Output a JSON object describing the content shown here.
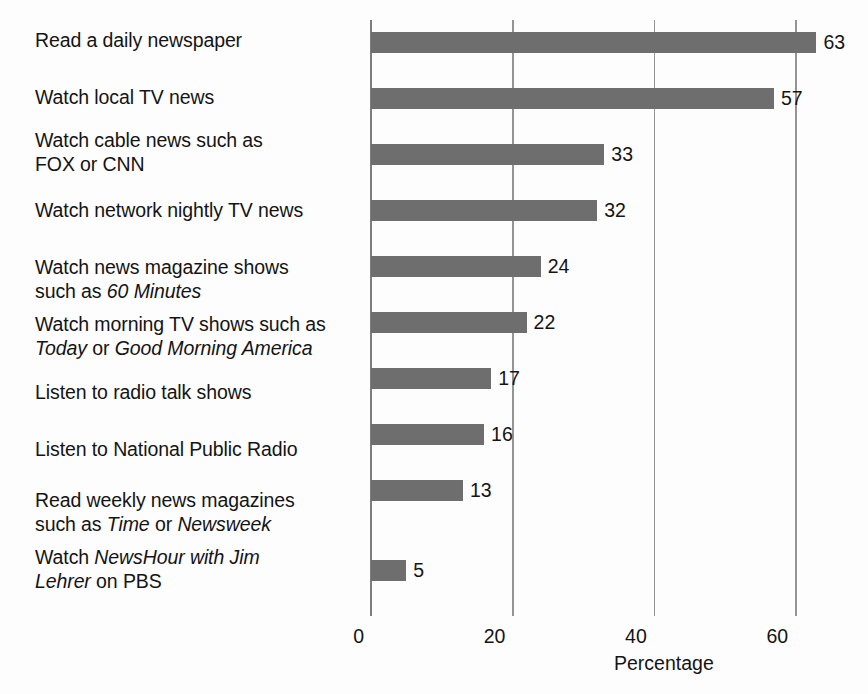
{
  "chart_data": {
    "type": "bar",
    "orientation": "horizontal",
    "title": "",
    "subtitle": "",
    "xlabel": "Percentage",
    "ylabel": "",
    "xlim": [
      0,
      67
    ],
    "xticks": [
      0,
      20,
      40,
      60
    ],
    "xtick_labels": [
      "0",
      "20",
      "40",
      "60"
    ],
    "grid": "vertical-gridlines-at-xticks",
    "legend": "none",
    "bar_color": "#6e6e6e",
    "value_labels_shown": true,
    "categories": [
      "Read a daily newspaper",
      "Watch local TV news",
      "Watch cable news such as FOX or CNN",
      "Watch network nightly TV news",
      "Watch news magazine shows such as 60 Minutes",
      "Watch morning TV shows such as Today or Good Morning America",
      "Listen to radio talk shows",
      "Listen to National Public Radio",
      "Read weekly news magazines such as Time or Newsweek",
      "Watch NewsHour with Jim Lehrer on PBS"
    ],
    "values": [
      63,
      57,
      33,
      32,
      24,
      22,
      17,
      16,
      13,
      5
    ]
  },
  "categories_rich": [
    {
      "id": "read-daily-newspaper",
      "lines": [
        [
          {
            "t": "Read a daily newspaper",
            "i": false
          }
        ]
      ],
      "value": 63,
      "value_text": "63"
    },
    {
      "id": "watch-local-tv-news",
      "lines": [
        [
          {
            "t": "Watch local TV news",
            "i": false
          }
        ]
      ],
      "value": 57,
      "value_text": "57"
    },
    {
      "id": "watch-cable-news",
      "lines": [
        [
          {
            "t": "Watch cable news such as",
            "i": false
          }
        ],
        [
          {
            "t": "FOX or CNN",
            "i": false
          }
        ]
      ],
      "value": 33,
      "value_text": "33"
    },
    {
      "id": "watch-network-nightly-tv-news",
      "lines": [
        [
          {
            "t": "Watch network nightly TV news",
            "i": false
          }
        ]
      ],
      "value": 32,
      "value_text": "32"
    },
    {
      "id": "watch-news-magazine-shows",
      "lines": [
        [
          {
            "t": "Watch news magazine shows",
            "i": false
          }
        ],
        [
          {
            "t": "such as ",
            "i": false
          },
          {
            "t": "60 Minutes",
            "i": true
          }
        ]
      ],
      "value": 24,
      "value_text": "24"
    },
    {
      "id": "watch-morning-tv-shows",
      "lines": [
        [
          {
            "t": "Watch morning TV shows such as",
            "i": false
          }
        ],
        [
          {
            "t": "Today",
            "i": true
          },
          {
            "t": " or ",
            "i": false
          },
          {
            "t": "Good Morning America",
            "i": true
          }
        ]
      ],
      "value": 22,
      "value_text": "22"
    },
    {
      "id": "listen-radio-talk-shows",
      "lines": [
        [
          {
            "t": "Listen to radio talk shows",
            "i": false
          }
        ]
      ],
      "value": 17,
      "value_text": "17"
    },
    {
      "id": "listen-national-public-radio",
      "lines": [
        [
          {
            "t": "Listen to National Public Radio",
            "i": false
          }
        ]
      ],
      "value": 16,
      "value_text": "16"
    },
    {
      "id": "read-weekly-news-magazines",
      "lines": [
        [
          {
            "t": "Read weekly news magazines",
            "i": false
          }
        ],
        [
          {
            "t": "such as ",
            "i": false
          },
          {
            "t": "Time",
            "i": true
          },
          {
            "t": " or ",
            "i": false
          },
          {
            "t": "Newsweek",
            "i": true
          }
        ]
      ],
      "value": 13,
      "value_text": "13"
    },
    {
      "id": "watch-newshour-pbs",
      "lines": [
        [
          {
            "t": "Watch ",
            "i": false
          },
          {
            "t": "NewsHour with Jim",
            "i": true
          }
        ],
        [
          {
            "t": "Lehrer",
            "i": true
          },
          {
            "t": " on PBS",
            "i": false
          }
        ]
      ],
      "value": 5,
      "value_text": "5"
    }
  ],
  "axis": {
    "x_title": "Percentage",
    "ticks": [
      {
        "value": 0,
        "label": "0"
      },
      {
        "value": 20,
        "label": "20"
      },
      {
        "value": 40,
        "label": "40"
      },
      {
        "value": 60,
        "label": "60"
      }
    ]
  },
  "colors": {
    "bar": "#6e6e6e",
    "text": "#141414",
    "gridline": "#949494",
    "background": "#fdfdfd"
  }
}
